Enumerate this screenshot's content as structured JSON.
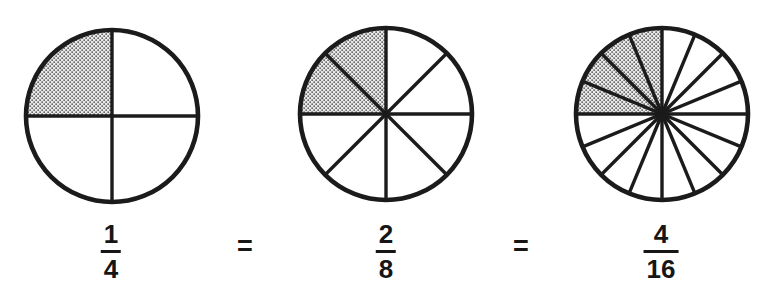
{
  "equals_sign": "=",
  "colors": {
    "stroke": "#1b1b1b",
    "stipple_dot": "#4d4d4d",
    "stipple_background": "#e9e9e9",
    "background": "#ffffff"
  },
  "circles": [
    {
      "name": "fourths",
      "total_parts": 4,
      "shaded_parts": 1,
      "shaded_start_deg": 90,
      "shaded_end_deg": 180,
      "fraction": {
        "numerator": "1",
        "denominator": "4"
      }
    },
    {
      "name": "eighths",
      "total_parts": 8,
      "shaded_parts": 2,
      "shaded_start_deg": 90,
      "shaded_end_deg": 180,
      "fraction": {
        "numerator": "2",
        "denominator": "8"
      }
    },
    {
      "name": "sixteenths",
      "total_parts": 16,
      "shaded_parts": 4,
      "shaded_start_deg": 90,
      "shaded_end_deg": 180,
      "fraction": {
        "numerator": "4",
        "denominator": "16"
      }
    }
  ]
}
